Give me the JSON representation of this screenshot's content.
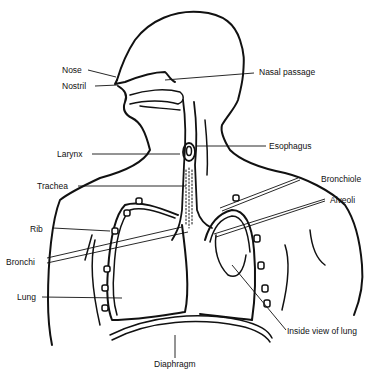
{
  "diagram": {
    "labels": {
      "nose": "Nose",
      "nostril": "Nostril",
      "nasal_passage": "Nasal passage",
      "larynx": "Larynx",
      "esophagus": "Esophagus",
      "trachea": "Trachea",
      "bronchiole": "Bronchiole",
      "alveoli": "Alveoli",
      "rib": "Rib",
      "bronchi": "Bronchi",
      "lung": "Lung",
      "inside_view": "Inside view of lung",
      "diaphragm": "Diaphragm"
    },
    "colors": {
      "ink": "#111111",
      "background": "#ffffff"
    }
  }
}
